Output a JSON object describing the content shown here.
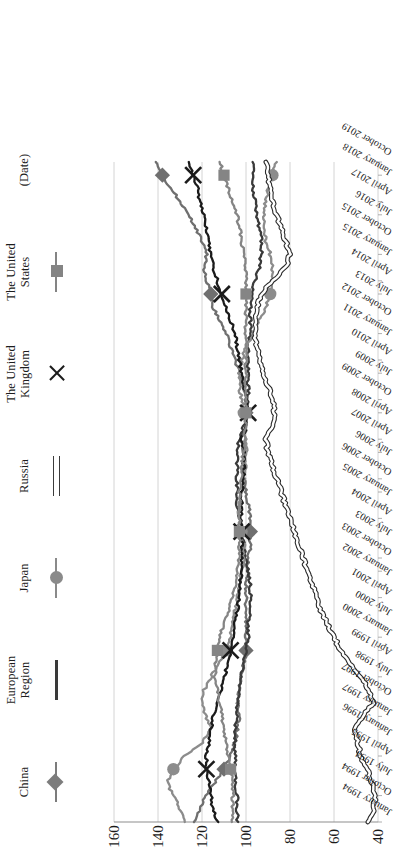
{
  "chart_data": {
    "type": "line",
    "title": "",
    "xlabel": "(Date)",
    "ylabel": "",
    "ylim": [
      40,
      160
    ],
    "yticks": [
      40,
      60,
      80,
      100,
      120,
      140,
      160
    ],
    "grid": true,
    "legend_position": "top",
    "orientation": "rotated-90-ccw",
    "x_tick_labels": [
      "January 1994",
      "October 1994",
      "July 1994",
      "April 1995",
      "January 1996",
      "January 1997",
      "October 1997",
      "July 1998",
      "April 1999",
      "January 2000",
      "July 2000",
      "April 2001",
      "January 2002",
      "October 2003",
      "July 2003",
      "April 2004",
      "January 2005",
      "October 2006",
      "July 2006",
      "April 2007",
      "April 2008",
      "October 2009",
      "July 2009",
      "April 2010",
      "January 2011",
      "October 2012",
      "July 2013",
      "April 2014",
      "January 2015",
      "October 2015",
      "July 2016",
      "April 2017",
      "January 2018",
      "October 2019"
    ],
    "x": [
      1994.0,
      1994.5,
      1995.0,
      1995.5,
      1996.0,
      1996.5,
      1997.0,
      1997.5,
      1998.0,
      1998.5,
      1999.0,
      1999.5,
      2000.0,
      2000.5,
      2001.0,
      2001.5,
      2002.0,
      2002.5,
      2003.0,
      2003.5,
      2004.0,
      2004.5,
      2005.0,
      2005.5,
      2006.0,
      2006.5,
      2007.0,
      2007.5,
      2008.0,
      2008.5,
      2009.0,
      2009.5,
      2010.0,
      2010.5,
      2011.0,
      2011.5,
      2012.0,
      2012.5,
      2013.0,
      2013.5,
      2014.0,
      2014.5,
      2015.0,
      2015.5,
      2016.0,
      2016.5,
      2017.0,
      2017.5,
      2018.0,
      2018.5,
      2019.0
    ],
    "series": [
      {
        "name": "China",
        "marker": "diamond",
        "color": "#6f6f6f",
        "values": [
          124,
          121,
          118,
          114,
          110,
          107,
          105,
          104,
          103,
          104,
          103,
          102,
          101,
          100,
          100,
          100,
          100,
          100,
          100,
          99,
          99,
          98,
          98,
          98,
          99,
          100,
          101,
          101,
          101,
          102,
          100,
          100,
          100,
          101,
          103,
          105,
          107,
          109,
          112,
          115,
          116,
          118,
          119,
          118,
          120,
          123,
          126,
          130,
          134,
          138,
          141
        ]
      },
      {
        "name": "European Region",
        "marker": "none",
        "color": "#3a3a3a",
        "values": [
          104,
          104,
          104,
          105,
          105,
          105,
          105,
          105,
          104,
          104,
          103,
          102,
          101,
          100,
          99,
          99,
          98,
          98,
          98,
          99,
          100,
          101,
          102,
          103,
          104,
          104,
          104,
          104,
          104,
          103,
          101,
          100,
          99,
          99,
          99,
          99,
          99,
          98,
          98,
          98,
          97,
          96,
          94,
          93,
          93,
          94,
          95,
          96,
          97,
          97,
          97
        ]
      },
      {
        "name": "Japan",
        "marker": "circle",
        "color": "#8c8c8c",
        "values": [
          128,
          130,
          133,
          136,
          133,
          128,
          120,
          116,
          118,
          120,
          119,
          116,
          112,
          109,
          107,
          106,
          105,
          104,
          103,
          102,
          101,
          101,
          102,
          103,
          103,
          102,
          101,
          100,
          100,
          100,
          100,
          101,
          102,
          103,
          103,
          102,
          100,
          97,
          94,
          91,
          89,
          88,
          88,
          89,
          91,
          92,
          92,
          91,
          90,
          88,
          86
        ]
      },
      {
        "name": "Russia",
        "marker": "hollow-line",
        "color": "#2b2b2b",
        "values": [
          44,
          42,
          41,
          43,
          45,
          48,
          49,
          51,
          47,
          42,
          44,
          48,
          53,
          57,
          60,
          63,
          66,
          68,
          70,
          72,
          74,
          76,
          78,
          80,
          82,
          84,
          86,
          88,
          90,
          91,
          88,
          87,
          88,
          90,
          92,
          94,
          95,
          96,
          96,
          95,
          93,
          88,
          82,
          80,
          82,
          84,
          86,
          88,
          89,
          90,
          91
        ]
      },
      {
        "name": "The United Kingdom",
        "marker": "x",
        "color": "#1b1b1b",
        "values": [
          113,
          115,
          116,
          117,
          118,
          118,
          117,
          116,
          115,
          113,
          111,
          110,
          108,
          107,
          106,
          105,
          104,
          103,
          103,
          102,
          102,
          102,
          102,
          102,
          102,
          102,
          101,
          101,
          101,
          102,
          100,
          99,
          100,
          101,
          102,
          103,
          104,
          105,
          107,
          109,
          111,
          113,
          115,
          116,
          117,
          118,
          119,
          121,
          122,
          124,
          126
        ]
      },
      {
        "name": "The United States",
        "marker": "square",
        "color": "#858585",
        "values": [
          106,
          106,
          106,
          106,
          107,
          108,
          109,
          110,
          111,
          112,
          113,
          114,
          114,
          113,
          112,
          110,
          108,
          106,
          105,
          104,
          103,
          103,
          103,
          103,
          103,
          103,
          102,
          102,
          101,
          101,
          100,
          100,
          100,
          100,
          100,
          100,
          100,
          100,
          100,
          100,
          100,
          100,
          100,
          101,
          102,
          103,
          104,
          106,
          108,
          110,
          112
        ]
      }
    ]
  },
  "legend": {
    "items": [
      {
        "label": "China",
        "key": "diamond",
        "color": "#7c7c7c"
      },
      {
        "label": "European\nRegion",
        "key": "line",
        "color": "#3a3a3a"
      },
      {
        "label": "Japan",
        "key": "circle",
        "color": "#8a8a8a"
      },
      {
        "label": "Russia",
        "key": "hollow-line",
        "color": "#3b3b3b"
      },
      {
        "label": "The United\nKingdom",
        "key": "x",
        "color": "#1b1b1b"
      },
      {
        "label": "The United\nStates",
        "key": "square",
        "color": "#848484"
      },
      {
        "label": "(Date)",
        "key": "none",
        "color": "#1a1a1a"
      }
    ]
  },
  "axis": {
    "y_tick_labels": [
      "160",
      "140",
      "120",
      "100",
      "80",
      "60",
      "40"
    ]
  }
}
